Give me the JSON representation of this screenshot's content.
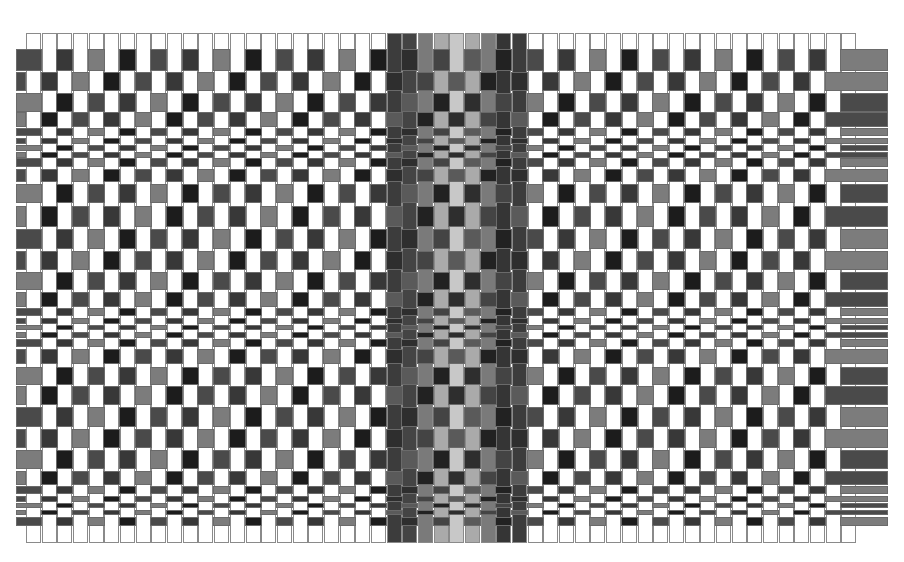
{
  "image": {
    "description": "Woven cloth simulation: plain-weave checker pattern with graduated weft row heights and a central band of shaded warp threads",
    "width": 904,
    "height": 562
  },
  "warp": {
    "x_start": 26,
    "pitch": 15.68,
    "count": 53,
    "width": 15,
    "y_top": 33,
    "y_bottom": 543,
    "default_color": "#ffffff",
    "band_start_index": 23,
    "band_colors": [
      "#3c3c3c",
      "#444444",
      "#7a7a7a",
      "#aaaaaa",
      "#c8c8c8",
      "#aaaaaa",
      "#7a7a7a",
      "#353535",
      "#3c3c3c"
    ]
  },
  "weft": {
    "x_left": 16,
    "x_right": 888,
    "palette": [
      "#4a4a4a",
      "#383838",
      "#7c7c7c",
      "#1c1c1c"
    ],
    "rows": [
      {
        "y": 49,
        "h": 22
      },
      {
        "y": 72,
        "h": 19
      },
      {
        "y": 93,
        "h": 19
      },
      {
        "y": 112,
        "h": 15
      },
      {
        "y": 128,
        "h": 8
      },
      {
        "y": 138,
        "h": 6
      },
      {
        "y": 145,
        "h": 6
      },
      {
        "y": 152,
        "h": 6
      },
      {
        "y": 158,
        "h": 9
      },
      {
        "y": 169,
        "h": 13
      },
      {
        "y": 184,
        "h": 19
      },
      {
        "y": 206,
        "h": 21
      },
      {
        "y": 229,
        "h": 20
      },
      {
        "y": 251,
        "h": 19
      },
      {
        "y": 272,
        "h": 18
      },
      {
        "y": 292,
        "h": 15
      },
      {
        "y": 308,
        "h": 8
      },
      {
        "y": 318,
        "h": 6
      },
      {
        "y": 325,
        "h": 5
      },
      {
        "y": 332,
        "h": 6
      },
      {
        "y": 339,
        "h": 8
      },
      {
        "y": 349,
        "h": 15
      },
      {
        "y": 367,
        "h": 18
      },
      {
        "y": 386,
        "h": 19
      },
      {
        "y": 407,
        "h": 20
      },
      {
        "y": 429,
        "h": 19
      },
      {
        "y": 450,
        "h": 19
      },
      {
        "y": 471,
        "h": 14
      },
      {
        "y": 486,
        "h": 8
      },
      {
        "y": 496,
        "h": 6
      },
      {
        "y": 503,
        "h": 5
      },
      {
        "y": 510,
        "h": 5
      },
      {
        "y": 517,
        "h": 9
      }
    ]
  }
}
